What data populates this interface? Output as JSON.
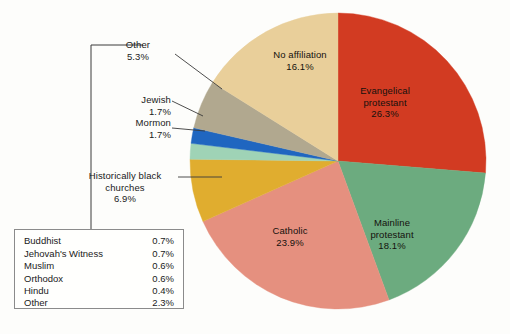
{
  "chart_data": {
    "type": "pie",
    "title": "",
    "subtitle": "",
    "xlabel": "",
    "ylabel": "",
    "grid": false,
    "legend_position": "bottom-left-inset",
    "units": "percent",
    "start_angle_deg": 0,
    "direction": "clockwise",
    "categories": [
      "Evangelical protestant",
      "Mainline protestant",
      "Catholic",
      "Historically black churches",
      "Mormon",
      "Jewish",
      "Other",
      "No affiliation"
    ],
    "values": [
      26.3,
      18.1,
      23.9,
      6.9,
      1.7,
      1.7,
      5.3,
      16.1
    ],
    "colors": [
      "#d23b22",
      "#6cab7f",
      "#e5907f",
      "#e0ad2f",
      "#9fd3b6",
      "#1f66c0",
      "#b1a88f",
      "#e9cf9a"
    ],
    "slices": [
      {
        "label": "Evangelical protestant",
        "value": 26.3,
        "value_label": "26.3%",
        "color": "#d23b22",
        "label_placement": "inside"
      },
      {
        "label": "Mainline protestant",
        "value": 18.1,
        "value_label": "18.1%",
        "color": "#6cab7f",
        "label_placement": "inside"
      },
      {
        "label": "Catholic",
        "value": 23.9,
        "value_label": "23.9%",
        "color": "#e5907f",
        "label_placement": "inside"
      },
      {
        "label": "Historically black churches",
        "value": 6.9,
        "value_label": "6.9%",
        "color": "#e0ad2f",
        "label_placement": "outside-leader"
      },
      {
        "label": "Mormon",
        "value": 1.7,
        "value_label": "1.7%",
        "color": "#9fd3b6",
        "label_placement": "outside-leader"
      },
      {
        "label": "Jewish",
        "value": 1.7,
        "value_label": "1.7%",
        "color": "#1f66c0",
        "label_placement": "outside-leader"
      },
      {
        "label": "Other",
        "value": 5.3,
        "value_label": "5.3%",
        "color": "#b1a88f",
        "label_placement": "outside-leader"
      },
      {
        "label": "No affiliation",
        "value": 16.1,
        "value_label": "16.1%",
        "color": "#e9cf9a",
        "label_placement": "inside"
      }
    ],
    "breakdown_title": "",
    "breakdown_of": "Other",
    "breakdown": [
      {
        "label": "Buddhist",
        "value": 0.7,
        "value_label": "0.7%"
      },
      {
        "label": "Jehovah's Witness",
        "value": 0.7,
        "value_label": "0.7%"
      },
      {
        "label": "Muslim",
        "value": 0.6,
        "value_label": "0.6%"
      },
      {
        "label": "Orthodox",
        "value": 0.6,
        "value_label": "0.6%"
      },
      {
        "label": "Hindu",
        "value": 0.4,
        "value_label": "0.4%"
      },
      {
        "label": "Other",
        "value": 2.3,
        "value_label": "2.3%"
      }
    ]
  },
  "labels": {
    "evangelical_line1": "Evangelical",
    "evangelical_line2": "protestant",
    "evangelical_value": "26.3%",
    "mainline_line1": "Mainline",
    "mainline_line2": "protestant",
    "mainline_value": "18.1%",
    "catholic_line1": "Catholic",
    "catholic_value": "23.9%",
    "noaffiliation_line1": "No affiliation",
    "noaffiliation_value": "16.1%",
    "hbc_line1": "Historically black",
    "hbc_line2": "churches",
    "hbc_value": "6.9%",
    "mormon_line1": "Mormon",
    "mormon_value": "1.7%",
    "jewish_line1": "Jewish",
    "jewish_value": "1.7%",
    "other_line1": "Other",
    "other_value": "5.3%"
  },
  "legend": {
    "rows": [
      {
        "name": "Buddhist",
        "value": "0.7%"
      },
      {
        "name": "Jehovah's Witness",
        "value": "0.7%"
      },
      {
        "name": "Muslim",
        "value": "0.6%"
      },
      {
        "name": "Orthodox",
        "value": "0.6%"
      },
      {
        "name": "Hindu",
        "value": "0.4%"
      },
      {
        "name": "Other",
        "value": "2.3%"
      }
    ]
  },
  "theme": {
    "background": "#fdfdfb",
    "text": "#1a1a1a",
    "leader_line": "#3a3a3a",
    "legend_border": "#8b8b8b"
  }
}
